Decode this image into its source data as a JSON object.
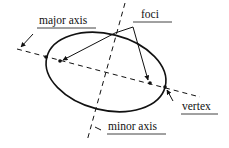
{
  "diagram": {
    "type": "ellipse-anatomy",
    "labels": {
      "major_axis": "major axis",
      "minor_axis": "minor axis",
      "foci": "foci",
      "vertex": "vertex"
    },
    "colors": {
      "stroke": "#111111",
      "background": "#ffffff"
    }
  }
}
